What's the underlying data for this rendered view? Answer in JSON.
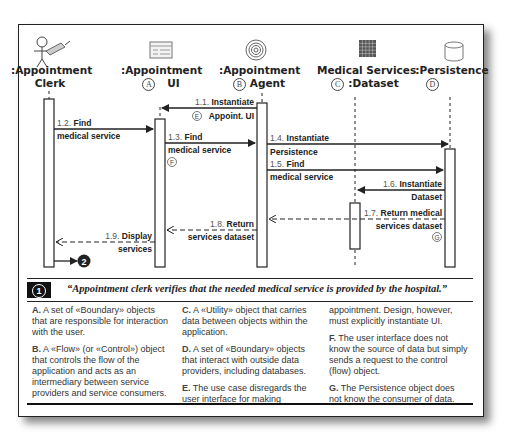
{
  "diagram": {
    "objects": [
      {
        "id": "clerk",
        "title_line1": ":Appointment",
        "title_line2": "Clerk",
        "marker": "",
        "icon": "actor-with-pencil-icon"
      },
      {
        "id": "ui",
        "title_line1": ":Appointment",
        "title_line2": "UI",
        "marker": "A",
        "icon": "boundary-form-icon"
      },
      {
        "id": "agent",
        "title_line1": ":Appointment",
        "title_line2": "Agent",
        "marker": "B",
        "icon": "spiral-control-icon"
      },
      {
        "id": "dataset",
        "title_line1": "Medical Services",
        "title_line2": ":Dataset",
        "marker": "C",
        "icon": "grid-utility-icon"
      },
      {
        "id": "persistence",
        "title_line1": ":Persistence",
        "title_line2": "",
        "marker": "D",
        "icon": "database-cylinder-icon"
      }
    ],
    "messages": [
      {
        "num": "1.1.",
        "label1": "Instantiate",
        "label2": "Appoint. UI",
        "marker": "E",
        "from": "agent",
        "to": "ui",
        "style": "solid"
      },
      {
        "num": "1.2.",
        "label1": "Find",
        "label2": "medical service",
        "marker": "",
        "from": "clerk",
        "to": "ui",
        "style": "solid"
      },
      {
        "num": "1.3.",
        "label1": "Find",
        "label2": "medical service",
        "marker": "F",
        "from": "ui",
        "to": "agent",
        "style": "solid"
      },
      {
        "num": "1.4.",
        "label1": "Instantiate",
        "label2": "Persistence",
        "marker": "",
        "from": "agent",
        "to": "persistence",
        "style": "solid"
      },
      {
        "num": "1.5.",
        "label1": "Find",
        "label2": "medical service",
        "marker": "",
        "from": "agent",
        "to": "persistence",
        "style": "solid"
      },
      {
        "num": "1.6.",
        "label1": "Instantiate",
        "label2": "Dataset",
        "marker": "",
        "from": "persistence",
        "to": "dataset",
        "style": "solid"
      },
      {
        "num": "1.7.",
        "label1": "Return medical",
        "label2": "services dataset",
        "marker": "G",
        "from": "persistence",
        "to": "agent",
        "style": "dashed"
      },
      {
        "num": "1.8.",
        "label1": "Return",
        "label2": "services dataset",
        "marker": "",
        "from": "agent",
        "to": "ui",
        "style": "dashed"
      },
      {
        "num": "1.9.",
        "label1": "Display",
        "label2": "services",
        "marker": "",
        "from": "ui",
        "to": "clerk",
        "style": "dashed"
      }
    ],
    "next_step_badge": "2"
  },
  "quote": {
    "step": "1",
    "text": "“Appointment clerk verifies that the needed medical service is provided by the hospital.”"
  },
  "notes": [
    {
      "letter": "A.",
      "text": "A set of «Boundary» objects that are responsible for interaction with the user."
    },
    {
      "letter": "B.",
      "text": "A «Flow» (or «Control») object that controls the flow of the application and acts as an intermediary between service providers and service consumers."
    },
    {
      "letter": "C.",
      "text": "A «Utility» object that carries data between objects within the application."
    },
    {
      "letter": "D.",
      "text": "A set of «Boundary» objects that interact with outside data providers, including databases."
    },
    {
      "letter": "E.",
      "text": "The use case disregards the user interface for making appointment. Design, however, must explicitly instantiate UI."
    },
    {
      "letter": "F.",
      "text": "The user interface does not know the source of data but simply sends a request to the control (flow) object."
    },
    {
      "letter": "G.",
      "text": "The Persistence object does not know the consumer of data."
    }
  ],
  "notes_columns": {
    "col1": [
      "A",
      "B"
    ],
    "col2": [
      "C",
      "D",
      "E_part1"
    ],
    "col3": [
      "E_part2",
      "F",
      "G"
    ]
  },
  "notes_split": {
    "E_part1": "The use case disregards the user interface for making",
    "E_part2": "appointment. Design, however, must explicitly instantiate UI."
  }
}
